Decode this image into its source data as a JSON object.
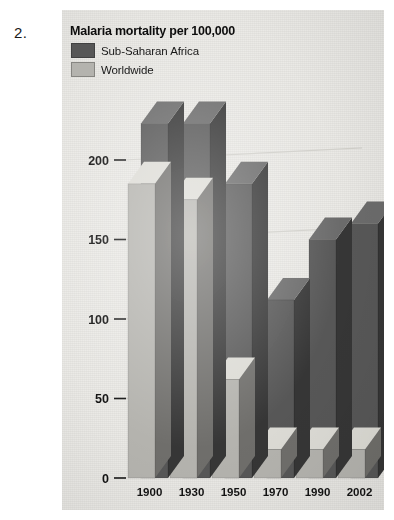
{
  "item_number": "2.",
  "chart_data": {
    "type": "bar",
    "title": "Malaria mortality per 100,000",
    "xlabel": "",
    "ylabel": "",
    "categories": [
      "1900",
      "1930",
      "1950",
      "1970",
      "1990",
      "2002"
    ],
    "series": [
      {
        "name": "Sub-Saharan Africa",
        "color": "#585858",
        "values": [
          223,
          223,
          185,
          112,
          150,
          160
        ]
      },
      {
        "name": "Worldwide",
        "color": "#b3b2ad",
        "values": [
          185,
          175,
          62,
          18,
          18,
          18
        ]
      }
    ],
    "ylim": [
      0,
      230
    ],
    "yticks": [
      0,
      50,
      100,
      150,
      200
    ],
    "ytick_labels": [
      "0",
      "50",
      "100",
      "150",
      "200"
    ],
    "grid": true,
    "legend_position": "top-left",
    "style": "3d-grouped-bar",
    "background_color": "#e8e7e3"
  }
}
